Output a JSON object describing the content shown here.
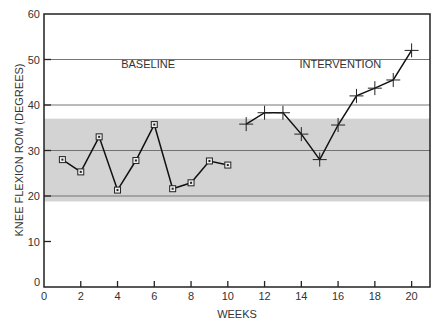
{
  "chart_data": {
    "type": "line",
    "title": "",
    "xlabel": "WEEKS",
    "ylabel": "KNEE FLEXION ROM (DEGREES)",
    "xlim": [
      0,
      21
    ],
    "ylim": [
      0,
      60
    ],
    "x_ticks": [
      0,
      2,
      4,
      6,
      8,
      10,
      12,
      14,
      16,
      18,
      20
    ],
    "y_ticks": [
      0,
      10,
      20,
      30,
      40,
      50,
      60
    ],
    "grid": {
      "horizontal": [
        20,
        30,
        40,
        50
      ],
      "vertical": false
    },
    "band": {
      "from": 18.8,
      "to": 37,
      "color": "#d3d3d3",
      "label": "baseline variability band"
    },
    "annotations": [
      {
        "text": "BASELINE",
        "x": 4.2,
        "y": 49
      },
      {
        "text": "INTERVENTION",
        "x": 13.9,
        "y": 49
      }
    ],
    "series": [
      {
        "name": "BASELINE",
        "marker": "square",
        "x": [
          1,
          2,
          3,
          4,
          5,
          6,
          7,
          8,
          9,
          10
        ],
        "values": [
          28,
          25.3,
          33,
          21.3,
          27.8,
          35.7,
          21.6,
          22.9,
          27.7,
          26.8
        ]
      },
      {
        "name": "INTERVENTION",
        "marker": "plus",
        "x": [
          11,
          12,
          13,
          14,
          15,
          16,
          17,
          18,
          19,
          20
        ],
        "values": [
          35.8,
          38.3,
          38.3,
          33.6,
          28,
          35.6,
          42,
          43.7,
          45.5,
          52
        ]
      }
    ]
  }
}
